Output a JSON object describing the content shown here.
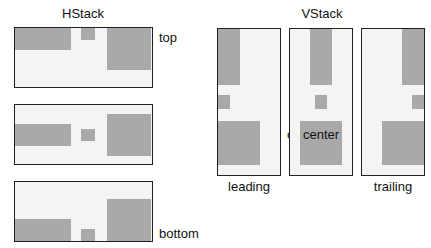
{
  "diagram": {
    "background_color": "#ffffff",
    "box_color": "#a9a9a9",
    "frame_border_color": "#231f20",
    "frame_fill_color": "#f4f4f4",
    "text_color": "#111111"
  },
  "hstack": {
    "title": "HStack",
    "rows": [
      {
        "alignment": "top",
        "label": "top"
      },
      {
        "alignment": "center",
        "label": "center"
      },
      {
        "alignment": "bottom",
        "label": "bottom"
      }
    ],
    "boxes": [
      {
        "name": "wide-short-box",
        "width": 56,
        "height": 22
      },
      {
        "name": "small-box",
        "width": 14,
        "height": 12
      },
      {
        "name": "wide-tall-box",
        "width": 44,
        "height": 42
      }
    ]
  },
  "vstack": {
    "title": "VStack",
    "columns": [
      {
        "alignment": "leading",
        "label": "leading"
      },
      {
        "alignment": "center",
        "label": "center"
      },
      {
        "alignment": "trailing",
        "label": "trailing"
      }
    ],
    "boxes": [
      {
        "name": "narrow-tall-box",
        "width": 22,
        "height": 56
      },
      {
        "name": "small-box",
        "width": 12,
        "height": 14
      },
      {
        "name": "wide-tall-box",
        "width": 42,
        "height": 44
      }
    ]
  }
}
